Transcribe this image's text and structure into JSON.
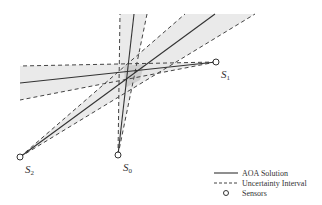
{
  "diagram": {
    "type": "aoa-triangulation",
    "colors": {
      "band_fill": "#e6e6e6",
      "overlap_fill": "#c8c8c8",
      "line": "#333333",
      "dash": "#444444"
    },
    "sensors": [
      {
        "id": "S0",
        "label": "S",
        "sub": "0",
        "x": 118,
        "y": 155
      },
      {
        "id": "S1",
        "label": "S",
        "sub": "1",
        "x": 216,
        "y": 62
      },
      {
        "id": "S2",
        "label": "S",
        "sub": "2",
        "x": 20,
        "y": 157
      }
    ]
  },
  "legend": {
    "items": [
      {
        "label": "AOA Solution",
        "style": "solid"
      },
      {
        "label": "Uncertainty Interval",
        "style": "dashed"
      },
      {
        "label": "Sensors",
        "style": "circle"
      }
    ]
  }
}
